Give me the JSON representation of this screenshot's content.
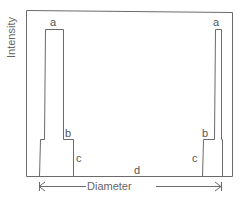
{
  "diagram": {
    "y_axis_label": "Intensity",
    "x_axis_label": "Diameter",
    "labels": {
      "left_peak_top": "a",
      "right_peak_top": "a",
      "left_step": "b",
      "right_step": "b",
      "left_base": "c",
      "right_base": "c",
      "baseline": "d"
    },
    "line_color": "#6a6a6a",
    "text_color": "#555555"
  }
}
